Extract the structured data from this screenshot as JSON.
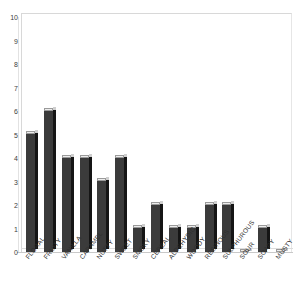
{
  "chart_data": {
    "type": "bar",
    "title": "",
    "subtitle": "",
    "xlabel": "",
    "ylabel": "",
    "ylim": [
      0,
      10
    ],
    "grid": false,
    "legend": null,
    "y_ticks": [
      0,
      1,
      2,
      3,
      4,
      5,
      6,
      7,
      8,
      9,
      10
    ],
    "y_tick_labels": [
      "0",
      "1",
      "2",
      "3",
      "4",
      "5",
      "6",
      "7",
      "8",
      "9",
      "10"
    ],
    "categories": [
      "FLORAL",
      "FRUITY",
      "VANILLA",
      "CARAMEL",
      "NUTTY",
      "SWEET",
      "SMOKY",
      "CEREAL",
      "ALDEHYDIC",
      "WOODY",
      "RESINOUS",
      "SULPHUROUS",
      "SOUR",
      "SOAPY",
      "MUSTY"
    ],
    "values": [
      5,
      6,
      4,
      4,
      3,
      4,
      1,
      2,
      1,
      1,
      2,
      2,
      0,
      1,
      0
    ],
    "colors": {
      "bar_face": "#3b3b3b",
      "bar_side": "#151515",
      "bar_top": "#ededed",
      "axis": "#d8d8d8",
      "text": "#2e2e2e",
      "background": "#ffffff"
    }
  }
}
